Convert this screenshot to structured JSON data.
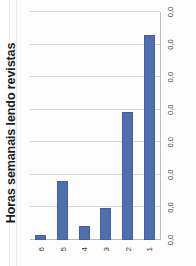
{
  "document": {
    "cropped_heading_fragment": "Painel"
  },
  "chart_data": {
    "type": "bar",
    "orientation": "vertical",
    "title": "Horas semanais lendo revistas",
    "xlabel": "",
    "ylabel": "",
    "categories": [
      "1",
      "2",
      "3",
      "4",
      "5",
      "6"
    ],
    "values": [
      0.45,
      0.28,
      0.07,
      0.03,
      0.13,
      0.01
    ],
    "value_tick_labels": [
      "0,0",
      "0,0",
      "0,0",
      "0,0",
      "0,0",
      "0,0",
      "0,0",
      "0,0"
    ],
    "ylim": [
      0,
      0.5
    ],
    "grid": true,
    "legend": false,
    "legend_position": "none",
    "series": [
      {
        "name": "Horas semanais lendo revistas",
        "values": [
          0.45,
          0.28,
          0.07,
          0.03,
          0.13,
          0.01
        ]
      }
    ],
    "colors": {
      "bar": "#4F6FB0",
      "bar_border": "#40609F",
      "gridline": "#D6D6D6",
      "axis": "#BDBDBD",
      "title_text": "#1D1D1D",
      "tick_text": "#3A3A3A",
      "heading_accent": "#E8973A",
      "background": "#FFFFFF"
    }
  }
}
